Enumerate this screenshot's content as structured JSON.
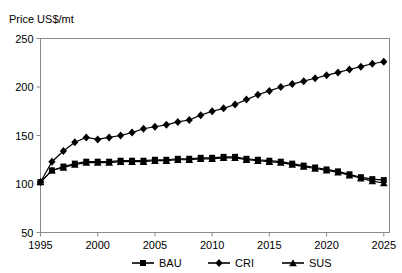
{
  "figure": {
    "top_artifact": "",
    "y_axis_title": "Price US$/mt"
  },
  "chart_data": {
    "type": "line",
    "title": "",
    "subtitle": "",
    "xlabel": "",
    "ylabel": "Price US$/mt",
    "xlim": [
      1995,
      2025.5
    ],
    "ylim": [
      50,
      250
    ],
    "ytick_labels": [
      "50",
      "100",
      "150",
      "200",
      "250"
    ],
    "yticks": [
      50,
      100,
      150,
      200,
      250
    ],
    "xtick_labels": [
      "1995",
      "2000",
      "2005",
      "2010",
      "2015",
      "2020",
      "2025"
    ],
    "xticks": [
      1995,
      2000,
      2005,
      2010,
      2015,
      2020,
      2025
    ],
    "grid": false,
    "legend_position": "bottom",
    "x": [
      1995,
      1996,
      1997,
      1998,
      1999,
      2000,
      2001,
      2002,
      2003,
      2004,
      2005,
      2006,
      2007,
      2008,
      2009,
      2010,
      2011,
      2012,
      2013,
      2014,
      2015,
      2016,
      2017,
      2018,
      2019,
      2020,
      2021,
      2022,
      2023,
      2024,
      2025
    ],
    "series": [
      {
        "name": "BAU",
        "marker": "square",
        "values": [
          102,
          114,
          118,
          121,
          123,
          123,
          123,
          124,
          124,
          124,
          125,
          125,
          126,
          126,
          127,
          127,
          128,
          128,
          126,
          125,
          124,
          123,
          121,
          119,
          117,
          115,
          113,
          110,
          107,
          105,
          104
        ]
      },
      {
        "name": "CRI",
        "marker": "diamond",
        "values": [
          102,
          123,
          134,
          143,
          148,
          146,
          148,
          150,
          153,
          157,
          159,
          161,
          164,
          166,
          171,
          175,
          178,
          182,
          187,
          192,
          196,
          200,
          203,
          206,
          209,
          212,
          215,
          218,
          221,
          224,
          226
        ]
      },
      {
        "name": "SUS",
        "marker": "triangle",
        "values": [
          102,
          114,
          117,
          120,
          122,
          122,
          122,
          123,
          123,
          123,
          124,
          124,
          125,
          125,
          126,
          126,
          127,
          127,
          125,
          124,
          123,
          122,
          120,
          118,
          116,
          114,
          112,
          109,
          106,
          103,
          101
        ]
      }
    ]
  },
  "legend": {
    "items": [
      {
        "label": "BAU",
        "marker": "square-marker"
      },
      {
        "label": "CRI",
        "marker": "diamond-marker"
      },
      {
        "label": "SUS",
        "marker": "triangle-marker"
      }
    ]
  }
}
